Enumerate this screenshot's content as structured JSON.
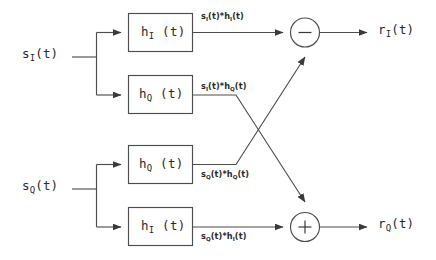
{
  "diagram": {
    "stroke_color": "#4d4d4d",
    "background_color": "#ffffff",
    "inputs": [
      {
        "name": "input-si",
        "text": "s",
        "subscript": "I",
        "suffix": "(t)"
      },
      {
        "name": "input-sq",
        "text": "s",
        "subscript": "Q",
        "suffix": "(t)"
      }
    ],
    "blocks": [
      {
        "name": "filter-hi-top",
        "text": "h",
        "subscript": "I",
        "suffix": "(t)"
      },
      {
        "name": "filter-hq-upper",
        "text": "h",
        "subscript": "Q",
        "suffix": "(t)"
      },
      {
        "name": "filter-hq-lower",
        "text": "h",
        "subscript": "Q",
        "suffix": "(t)"
      },
      {
        "name": "filter-hi-bottom",
        "text": "h",
        "subscript": "I",
        "suffix": "(t)"
      }
    ],
    "edge_labels": [
      {
        "name": "edge-si-hi",
        "a": "s",
        "asub": "I",
        "amid": "(t)*h",
        "bsub": "I",
        "tail": "(t)"
      },
      {
        "name": "edge-si-hq",
        "a": "s",
        "asub": "I",
        "amid": "(t)*h",
        "bsub": "Q",
        "tail": "(t)"
      },
      {
        "name": "edge-sq-hq",
        "a": "s",
        "asub": "Q",
        "amid": "(t)*h",
        "bsub": "Q",
        "tail": "(t)"
      },
      {
        "name": "edge-sq-hi",
        "a": "s",
        "asub": "Q",
        "amid": "(t)*h",
        "bsub": "I",
        "tail": "(t)"
      }
    ],
    "operators": [
      {
        "name": "summing-junction-minus",
        "symbol": "−"
      },
      {
        "name": "summing-junction-plus",
        "symbol": "+"
      }
    ],
    "outputs": [
      {
        "name": "output-ri",
        "text": "r",
        "subscript": "I",
        "suffix": "(t)"
      },
      {
        "name": "output-rq",
        "text": "r",
        "subscript": "Q",
        "suffix": "(t)"
      }
    ]
  }
}
